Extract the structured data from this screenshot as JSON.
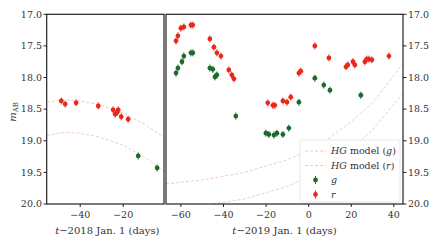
{
  "chart_data": {
    "type": "scatter",
    "ylabel": "m_AB",
    "ylim": [
      20.0,
      17.0
    ],
    "y_ticks": [
      "17.0",
      "17.5",
      "18.0",
      "18.5",
      "19.0",
      "19.5",
      "20.0"
    ],
    "panels": [
      {
        "name": "2018",
        "xlabel": "t−2018 Jan. 1 (days)",
        "xlim": [
          -55.6,
          -1.0
        ],
        "x_ticks": [
          -40,
          -20
        ],
        "x_tick_labels": [
          "−40",
          "−20"
        ],
        "series": [
          {
            "name": "r",
            "color": "#e8291c",
            "x": [
              -48.8,
              -47.0,
              -41.9,
              -31.6,
              -24.7,
              -23.7,
              -22.8,
              -22.3,
              -20.9,
              -17.7
            ],
            "y": [
              18.37,
              18.42,
              18.4,
              18.45,
              18.51,
              18.58,
              18.55,
              18.51,
              18.62,
              18.66
            ]
          },
          {
            "name": "g",
            "color": "#1d6b2c",
            "x": [
              -13.0,
              -4.2
            ],
            "y": [
              19.24,
              19.43
            ]
          }
        ],
        "models": [
          {
            "name": "HG model (r)",
            "x": [
              -55.6,
              -50,
              -45,
              -40,
              -30,
              -20,
              -10,
              -1
            ],
            "y": [
              18.39,
              18.36,
              18.36,
              18.37,
              18.44,
              18.56,
              18.74,
              18.94
            ]
          },
          {
            "name": "HG model (g)",
            "x": [
              -55.6,
              -50,
              -45,
              -40,
              -30,
              -20,
              -10,
              -1
            ],
            "y": [
              18.92,
              18.88,
              18.87,
              18.88,
              18.95,
              19.07,
              19.26,
              19.48
            ]
          }
        ]
      },
      {
        "name": "2019",
        "xlabel": "t−2019 Jan. 1 (days)",
        "xlim": [
          -67.0,
          44.3
        ],
        "x_ticks": [
          -60,
          -40,
          -20,
          0,
          20,
          40
        ],
        "x_tick_labels": [
          "−60",
          "−40",
          "−20",
          "0",
          "20",
          "40"
        ],
        "series": [
          {
            "name": "r",
            "color": "#e8291c",
            "x": [
              -62.3,
              -61.4,
              -60.0,
              -58.6,
              -55.3,
              -54.4,
              -46.4,
              -44.5,
              -43.1,
              -41.2,
              -37.5,
              -36.1,
              -35.1,
              -19.2,
              -16.8,
              -15.9,
              -12.1,
              -10.2,
              -8.4,
              -4.6,
              -3.7,
              2.9,
              9.5,
              17.5,
              18.4,
              20.8,
              21.7,
              26.4,
              27.3,
              28.3,
              29.7,
              37.7
            ],
            "y": [
              17.42,
              17.34,
              17.22,
              17.2,
              17.17,
              17.17,
              17.39,
              17.52,
              17.61,
              17.66,
              17.88,
              17.96,
              18.02,
              18.4,
              18.44,
              18.44,
              18.37,
              18.39,
              18.31,
              17.93,
              17.9,
              17.5,
              17.69,
              17.83,
              17.8,
              17.75,
              17.8,
              17.75,
              17.71,
              17.71,
              17.72,
              17.66
            ]
          },
          {
            "name": "g",
            "color": "#1d6b2c",
            "x": [
              -62.3,
              -61.4,
              -59.5,
              -58.6,
              -55.3,
              -54.4,
              -46.4,
              -45.0,
              -44.0,
              -43.1,
              -34.2,
              -20.1,
              -18.7,
              -16.3,
              -14.9,
              -12.1,
              -9.3,
              -4.6,
              2.9,
              7.1,
              10.0,
              24.5
            ],
            "y": [
              17.93,
              17.85,
              17.75,
              17.66,
              17.61,
              17.61,
              17.85,
              17.87,
              17.99,
              17.96,
              18.61,
              18.88,
              18.9,
              18.91,
              18.88,
              18.9,
              18.8,
              18.39,
              18.01,
              18.12,
              18.2,
              18.28
            ]
          }
        ],
        "models": [
          {
            "name": "HG model (r)",
            "x": [
              -67,
              -50,
              -30,
              -10,
              0,
              10,
              20,
              30,
              44.3
            ],
            "y": [
              19.68,
              19.62,
              19.5,
              19.3,
              19.15,
              18.95,
              18.7,
              18.4,
              17.78
            ]
          },
          {
            "name": "HG model (g)",
            "x": [
              -45,
              -30,
              -10,
              0,
              10,
              20,
              30,
              44.3
            ],
            "y": [
              20.0,
              19.92,
              19.72,
              19.57,
              19.38,
              19.13,
              18.83,
              18.25
            ]
          }
        ]
      }
    ],
    "legend": {
      "position": "lower right",
      "entries": [
        {
          "label": "HG model (g)",
          "style": "dashed",
          "color": "#f2c4c0"
        },
        {
          "label": "HG model (r)",
          "style": "dashed",
          "color": "#f2c4c0"
        },
        {
          "label": "g",
          "style": "errorbar-marker",
          "color": "#1d6b2c"
        },
        {
          "label": "r",
          "style": "errorbar-marker",
          "color": "#e8291c"
        }
      ]
    }
  },
  "labels": {
    "ylabel": "m",
    "ylabel_sub": "AB",
    "legend_g_model_italic": "HG",
    "legend_g_model_rest": " model (",
    "legend_g_model_band": "g",
    "legend_r_model_band": "r",
    "legend_g": "g",
    "legend_r": "r"
  }
}
